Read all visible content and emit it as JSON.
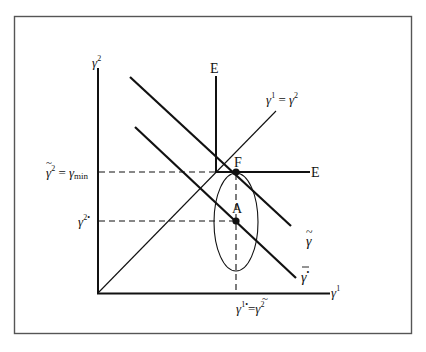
{
  "diagram": {
    "type": "economic-diagram",
    "axes": {
      "x_label": "γ¹",
      "y_label": "γ²"
    },
    "lines": {
      "diagonal_label": "γ¹ = γ²",
      "upper_parallel_label": "γ̃",
      "lower_parallel_label": "γ̄*",
      "vertical_branch_label": "E",
      "horizontal_branch_label": "E"
    },
    "points": {
      "F": "F",
      "A": "A"
    },
    "y_tick_labels": {
      "upper": "γ̃² = γmin",
      "upper_main": "γ̃",
      "upper_sup": "2",
      "upper_eq": "= γ",
      "upper_sub": "min",
      "lower": "γ²*",
      "lower_main": "γ",
      "lower_sup": "2•"
    },
    "x_tick_label": {
      "full": "γ¹* = γ̃²",
      "left_main": "γ",
      "left_sup": "1•",
      "eq": "=",
      "right_main": "γ̃",
      "right_sup": "2"
    },
    "colors": {
      "ink": "#111111",
      "frame": "#555555",
      "background": "#ffffff"
    }
  }
}
